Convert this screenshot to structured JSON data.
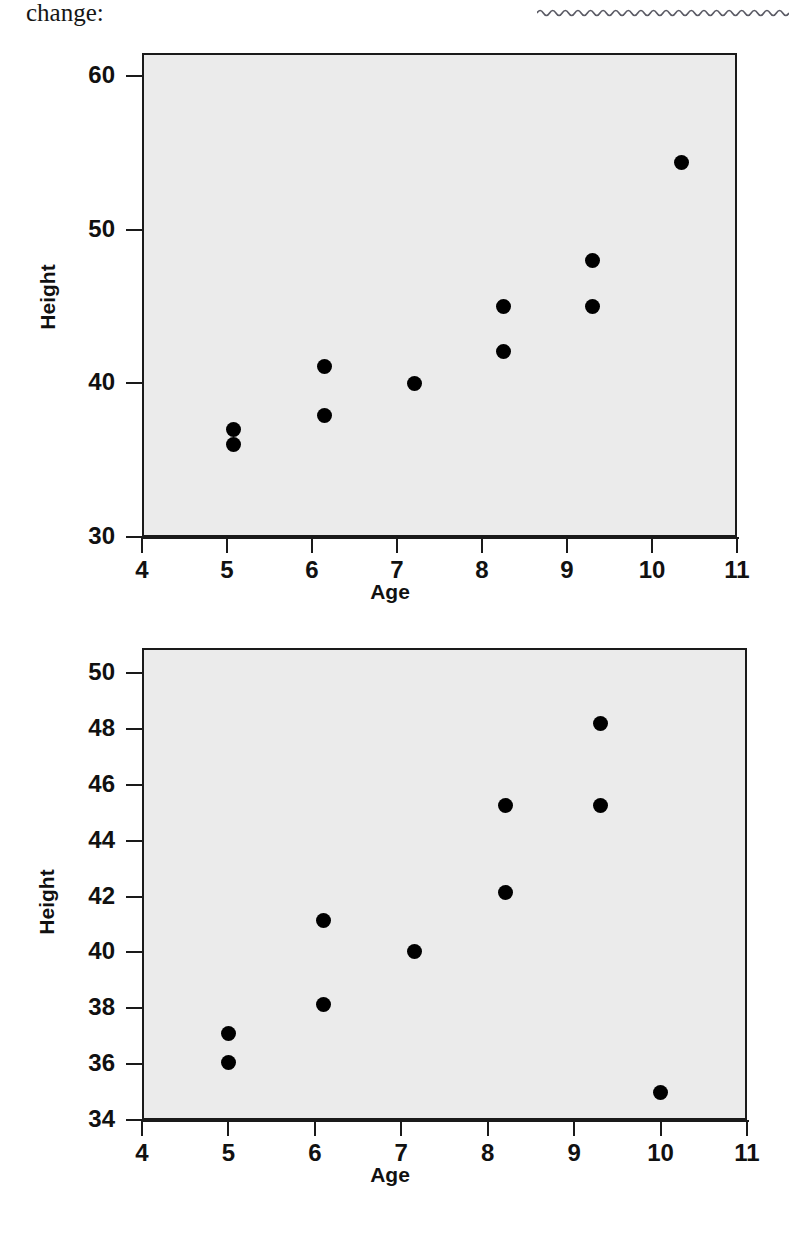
{
  "page": {
    "text_fragment": "change:",
    "squiggle_rule": "wavy-horizontal-rule"
  },
  "chart_data": [
    {
      "id": "chart-top",
      "type": "scatter",
      "title": "",
      "xlabel": "Age",
      "ylabel": "Height",
      "xlim": [
        4,
        11
      ],
      "ylim": [
        30,
        61.5
      ],
      "grid": false,
      "legend": "none",
      "xticks": [
        "4",
        "5",
        "6",
        "7",
        "8",
        "9",
        "10",
        "11"
      ],
      "xtick_values": [
        4,
        5,
        6,
        7,
        8,
        9,
        10,
        11
      ],
      "yticks": [
        "30",
        "40",
        "50",
        "60"
      ],
      "ytick_values": [
        30,
        40,
        50,
        60
      ],
      "marker": "filled-circle",
      "marker_color": "#000000",
      "plot_bg": "#ebebeb",
      "points": [
        {
          "x": 5.08,
          "y": 37.0
        },
        {
          "x": 5.08,
          "y": 36.0
        },
        {
          "x": 6.15,
          "y": 41.1
        },
        {
          "x": 6.15,
          "y": 37.9
        },
        {
          "x": 7.2,
          "y": 40.0
        },
        {
          "x": 8.25,
          "y": 45.0
        },
        {
          "x": 8.25,
          "y": 42.1
        },
        {
          "x": 9.3,
          "y": 48.0
        },
        {
          "x": 9.3,
          "y": 45.0
        },
        {
          "x": 10.35,
          "y": 54.4
        }
      ]
    },
    {
      "id": "chart-bottom",
      "type": "scatter",
      "title": "",
      "xlabel": "Age",
      "ylabel": "Height",
      "xlim": [
        4,
        11
      ],
      "ylim": [
        34,
        50.9
      ],
      "grid": false,
      "legend": "none",
      "xticks": [
        "4",
        "5",
        "6",
        "7",
        "8",
        "9",
        "10",
        "11"
      ],
      "xtick_values": [
        4,
        5,
        6,
        7,
        8,
        9,
        10,
        11
      ],
      "yticks": [
        "34",
        "36",
        "38",
        "40",
        "42",
        "44",
        "46",
        "48",
        "50"
      ],
      "ytick_values": [
        34,
        36,
        38,
        40,
        42,
        44,
        46,
        48,
        50
      ],
      "marker": "filled-circle",
      "marker_color": "#000000",
      "plot_bg": "#ebebeb",
      "points": [
        {
          "x": 5.0,
          "y": 37.1
        },
        {
          "x": 5.0,
          "y": 36.05
        },
        {
          "x": 6.1,
          "y": 41.15
        },
        {
          "x": 6.1,
          "y": 38.15
        },
        {
          "x": 7.15,
          "y": 40.05
        },
        {
          "x": 8.2,
          "y": 45.25
        },
        {
          "x": 8.2,
          "y": 42.15
        },
        {
          "x": 9.3,
          "y": 48.2
        },
        {
          "x": 9.3,
          "y": 45.25
        },
        {
          "x": 10.0,
          "y": 35.0
        }
      ]
    }
  ]
}
